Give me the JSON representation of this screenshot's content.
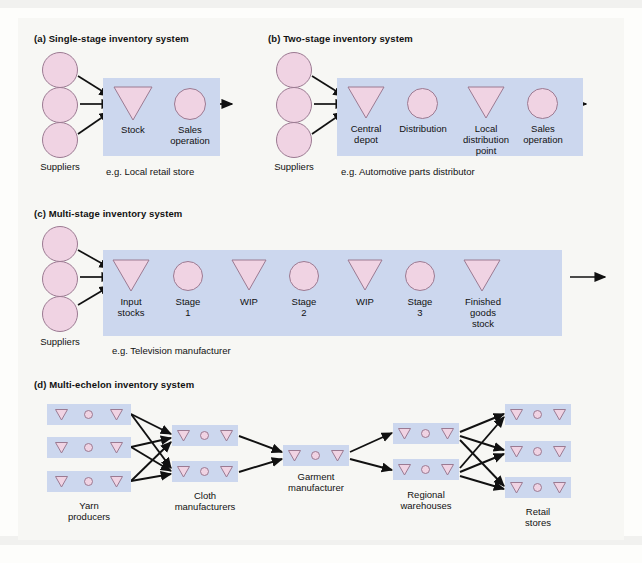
{
  "figure": {
    "background_color": "#f7f7f4",
    "band_color": "#ccd7ee",
    "node_fill": "#f0d3e3",
    "node_stroke": "#9b7a92",
    "arrow_color": "#111111"
  },
  "sections": {
    "a": {
      "title": "(a) Single-stage inventory system",
      "suppliers_label": "Suppliers",
      "nodes": [
        {
          "shape": "triangle",
          "label": "Stock"
        },
        {
          "shape": "circle",
          "label": "Sales\noperation",
          "label_line1": "Sales",
          "label_line2": "operation"
        }
      ],
      "example": "e.g. Local retail store"
    },
    "b": {
      "title": "(b) Two-stage inventory system",
      "suppliers_label": "Suppliers",
      "nodes": [
        {
          "shape": "triangle",
          "label_line1": "Central",
          "label_line2": "depot"
        },
        {
          "shape": "circle",
          "label_line1": "Distribution",
          "label_line2": ""
        },
        {
          "shape": "triangle",
          "label_line1": "Local",
          "label_line2": "distribution",
          "label_line3": "point"
        },
        {
          "shape": "circle",
          "label_line1": "Sales",
          "label_line2": "operation"
        }
      ],
      "example": "e.g. Automotive parts distributor"
    },
    "c": {
      "title": "(c) Multi-stage inventory system",
      "suppliers_label": "Suppliers",
      "nodes": [
        {
          "shape": "triangle",
          "label_line1": "Input",
          "label_line2": "stocks"
        },
        {
          "shape": "circle",
          "label_line1": "Stage",
          "label_line2": "1"
        },
        {
          "shape": "triangle",
          "label_line1": "WIP",
          "label_line2": ""
        },
        {
          "shape": "circle",
          "label_line1": "Stage",
          "label_line2": "2"
        },
        {
          "shape": "triangle",
          "label_line1": "WIP",
          "label_line2": ""
        },
        {
          "shape": "circle",
          "label_line1": "Stage",
          "label_line2": "3"
        },
        {
          "shape": "triangle",
          "label_line1": "Finished",
          "label_line2": "goods",
          "label_line3": "stock"
        }
      ],
      "example": "e.g. Television manufacturer"
    },
    "d": {
      "title": "(d) Multi-echelon inventory system",
      "echelons": [
        {
          "name": "yarn-producers",
          "label_line1": "Yarn",
          "label_line2": "producers",
          "count": 3
        },
        {
          "name": "cloth-manufacturers",
          "label_line1": "Cloth",
          "label_line2": "manufacturers",
          "count": 2
        },
        {
          "name": "garment-manufacturer",
          "label_line1": "Garment",
          "label_line2": "manufacturer",
          "count": 1
        },
        {
          "name": "regional-warehouses",
          "label_line1": "Regional",
          "label_line2": "warehouses",
          "count": 2
        },
        {
          "name": "retail-stores",
          "label_line1": "Retail",
          "label_line2": "stores",
          "count": 3
        }
      ],
      "group_glyphs": [
        "triangle",
        "circle",
        "triangle"
      ]
    }
  }
}
